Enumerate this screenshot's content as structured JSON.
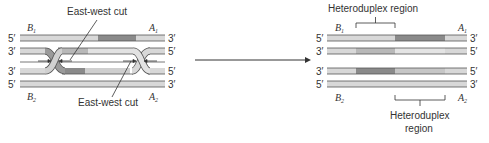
{
  "left_panel": {
    "cut_label_top": "East-west cut",
    "cut_label_bottom": "East-west cut",
    "labels": {
      "b1": "B",
      "b1_sub": "1",
      "a1": "A",
      "a1_sub": "1",
      "b2": "B",
      "b2_sub": "2",
      "a2": "A",
      "a2_sub": "2"
    },
    "ends_left": [
      "5′",
      "3′",
      "3′",
      "5′"
    ],
    "ends_right": [
      "3′",
      "5′",
      "5′",
      "3′"
    ]
  },
  "right_panel": {
    "hetero_top": "Heteroduplex region",
    "hetero_bottom_1": "Heteroduplex",
    "hetero_bottom_2": "region",
    "labels": {
      "b1": "B",
      "b1_sub": "1",
      "a1": "A",
      "a1_sub": "1",
      "b2": "B",
      "b2_sub": "2",
      "a2": "A",
      "a2_sub": "2"
    },
    "ends_left": [
      "5′",
      "3′",
      "3′",
      "5′"
    ],
    "ends_right": [
      "3′",
      "5′",
      "5′",
      "3′"
    ]
  },
  "colors": {
    "light": "#d8d8d8",
    "mid": "#b8b8b8",
    "dark": "#8a8a8a",
    "line": "#555555"
  }
}
